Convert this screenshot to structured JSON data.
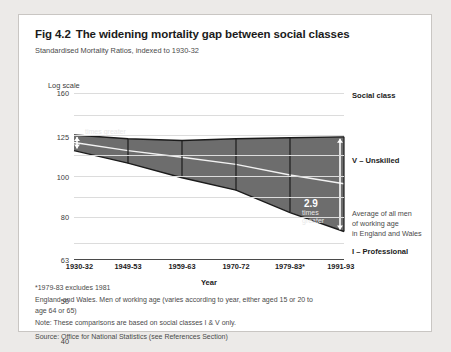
{
  "figure": {
    "fig_number": "Fig 4.2",
    "title": "The widening mortality gap between social classes",
    "subtitle": "Standardised Mortality Ratios, indexed to 1930-32"
  },
  "axis": {
    "y_scale_label": "Log scale",
    "x_label": "Year"
  },
  "legend": {
    "header": "Social class",
    "top_class": "V – Unskilled",
    "bottom_class": "I – Professional",
    "average_line1": "Average of all men",
    "average_line2": "of working age",
    "average_line3": "in England and Wales"
  },
  "annotations": {
    "left_value": "1.2",
    "left_caption": "times greater",
    "right_value": "2.9",
    "right_caption_line1": "times",
    "right_caption_line2": "greater"
  },
  "notes": {
    "asterisk": "*1979-83 excludes 1981",
    "coverage_line1": "England and Wales. Men of working age (varies according to year, either aged 15 or 20 to",
    "coverage_line2": "age 64 or 65)",
    "note": "Note: These comparisons are based on social classes I & V only.",
    "source": "Source: Office for National Statistics (see References Section)"
  },
  "colors": {
    "band": "#6d6d6d",
    "band_edge": "#1b1b1b",
    "average_line": "#f2f2f2",
    "grid": "#dcdcdc",
    "axis": "#4a4a4a",
    "page_background": "#eceae8",
    "card_background": "#ffffff"
  },
  "chart_data": {
    "type": "area",
    "title": "The widening mortality gap between social classes",
    "subtitle": "Standardised Mortality Ratios, indexed to 1930-32",
    "xlabel": "Year",
    "ylabel": "Log scale",
    "y_scale": "log",
    "ylim": [
      25,
      160
    ],
    "yticks": [
      160,
      125,
      100,
      80,
      63,
      50,
      40,
      30,
      25
    ],
    "grid": true,
    "legend_position": "right",
    "categories": [
      "1930-32",
      "1949-53",
      "1959-63",
      "1970-72",
      "1979-83*",
      "1991-93"
    ],
    "series": [
      {
        "name": "V – Unskilled",
        "values": [
          100,
          96,
          94,
          96,
          97,
          98
        ]
      },
      {
        "name": "Average of all men of working age in England and Wales",
        "values": [
          92,
          84,
          78,
          72,
          64,
          58
        ]
      },
      {
        "name": "I – Professional",
        "values": [
          84,
          73,
          62,
          54,
          42,
          34
        ]
      }
    ],
    "ratio_annotations": [
      {
        "category": "1930-32",
        "value": "1.2",
        "caption": "times greater"
      },
      {
        "category": "1991-93",
        "value": "2.9",
        "caption": "times greater"
      }
    ]
  }
}
